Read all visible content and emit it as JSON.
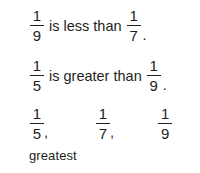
{
  "worksheet": {
    "statements": [
      {
        "left_fraction": {
          "numerator": "1",
          "denominator": "9"
        },
        "relation": "is less than",
        "right_fraction": {
          "numerator": "1",
          "denominator": "7"
        },
        "punctuation": "."
      },
      {
        "left_fraction": {
          "numerator": "1",
          "denominator": "5"
        },
        "relation": "is greater than",
        "right_fraction": {
          "numerator": "1",
          "denominator": "9"
        },
        "punctuation": "."
      }
    ],
    "ordered_list": {
      "items": [
        {
          "numerator": "1",
          "denominator": "5",
          "separator": ","
        },
        {
          "numerator": "1",
          "denominator": "7",
          "separator": ","
        },
        {
          "numerator": "1",
          "denominator": "9",
          "separator": ""
        }
      ],
      "caption": "greatest"
    },
    "colors": {
      "text": "#231f20",
      "background": "#ffffff"
    }
  }
}
